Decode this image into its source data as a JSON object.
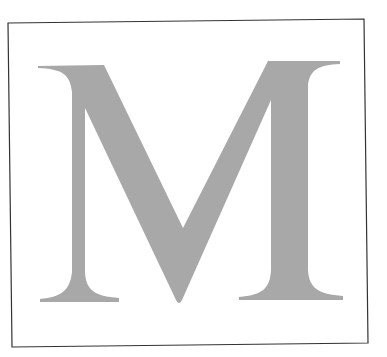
{
  "figure": {
    "letter": "M",
    "colors": {
      "background": "#ffffff",
      "frame": "#333333",
      "letter": "#a8a8a8"
    }
  }
}
